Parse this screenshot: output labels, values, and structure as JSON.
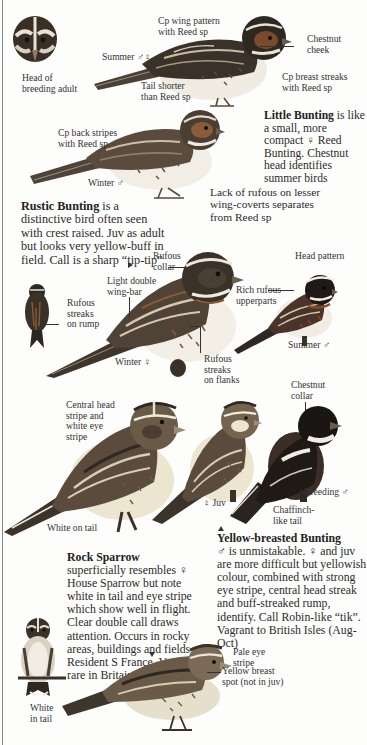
{
  "colors": {
    "paper": "#fdfdfc",
    "ink": "#2b2b2b",
    "bird_dark": "#2c2620",
    "bird_mid": "#6b5a46",
    "bird_rufous": "#8a5a34",
    "bird_belly": "#f1ede4",
    "bird_yellow": "#e8dcae",
    "edge_line": "#8a8a8a"
  },
  "little_bunting": {
    "labels": {
      "head": "Head of\nbreeding adult",
      "wing_pattern": "Cp wing pattern\nwith Reed sp",
      "summer": "Summer ♂♀",
      "chestnut_cheek": "Chestnut\ncheek",
      "tail": "Tail shorter\nthan Reed sp",
      "breast": "Cp breast streaks\nwith Reed sp",
      "back": "Cp back stripes\nwith Reed sp",
      "winter": "Winter ♂",
      "lesser_coverts": "Lack of rufous on lesser\nwing-coverts separates\nfrom Reed sp"
    },
    "description": {
      "name": "Little Bunting",
      "text": " is like a small, more compact ♀ Reed Bunting. Chestnut head identifies summer birds"
    }
  },
  "rustic_bunting": {
    "description": {
      "name": "Rustic Bunting",
      "text": " is a distinctive bird often seen with crest raised. Juv as adult but looks very yellow-buff in field. Call is a sharp “tip-tip”"
    },
    "labels": {
      "rufous_collar": "Rufous\ncollar",
      "wing_bar": "Light double\nwing-bar",
      "rump": "Rufous\nstreaks\non rump",
      "winter_female": "Winter ♀",
      "flanks": "Rufous\nstreaks\non flanks",
      "head_pattern": "Head pattern",
      "upperparts": "Rich rufous\nupperparts",
      "summer_male": "Summer ♂"
    }
  },
  "yellow_breasted_bunting": {
    "labels": {
      "head_stripe": "Central head\nstripe and\nwhite eye\nstripe",
      "white_tail": "White on tail",
      "juv": "♀ Juv",
      "chestnut_collar": "Chestnut\ncollar",
      "breeding": "Breeding ♂",
      "chaffinch_tail": "Chaffinch-\nlike tail"
    },
    "description": {
      "name": "Yellow-breasted Bunting",
      "text": "♂ is unmistakable. ♀ and juv are more difficult but yellowish colour, combined with strong eye stripe, central head streak and buff-streaked rump, identify. Call Robin-like “tik”. Vagrant to British Isles (Aug-Oct)"
    }
  },
  "rock_sparrow": {
    "description": {
      "name": "Rock Sparrow",
      "text": " superficially resembles ♀ House Sparrow but note white in tail and eye stripe which show well in flight. Clear double call draws attention. Occurs in rocky areas, buildings and fields. Resident S France. Very rare in Britain"
    },
    "labels": {
      "white_tail": "White\nin tail",
      "pale_eye": "Pale eye\nstripe",
      "yellow_spot": "Yellow breast\nspot (not in juv)"
    }
  }
}
